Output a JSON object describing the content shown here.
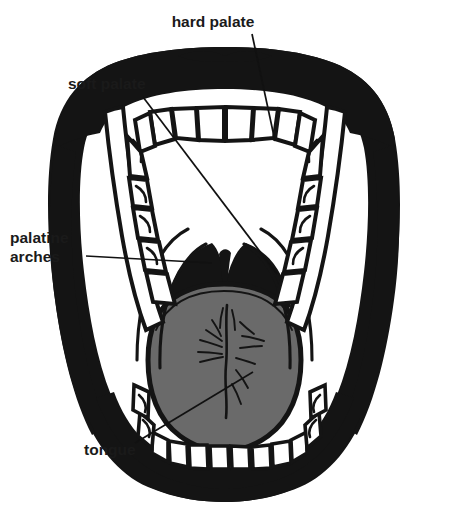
{
  "figure": {
    "view": "open mouth, anterior view",
    "background_color": "#ffffff",
    "ink_color": "#141414",
    "tongue_color": "#6a6a6a",
    "teeth_color": "#ffffff"
  },
  "labels": [
    {
      "id": "hard-palate",
      "text": "hard palate",
      "text_x": 213,
      "text_y": 27,
      "anchor": "middle",
      "leader": "M 252 34 L 275 141"
    },
    {
      "id": "soft-palate",
      "text": "soft palate",
      "text_x": 68,
      "text_y": 89,
      "anchor": "start",
      "leader": "M 143 97 L 277 274"
    },
    {
      "id": "palatine-arches",
      "text_line_1": "palatine",
      "text_line_2": "arches",
      "text_x": 10,
      "text_y": 243,
      "text_y2": 262,
      "anchor": "start",
      "leader": "M 86 256 L 212 263"
    },
    {
      "id": "tongue",
      "text": "tongue",
      "text_x": 84,
      "text_y": 455,
      "anchor": "start",
      "leader": "M 135 443 L 253 372"
    }
  ],
  "structures": [
    {
      "id": "lips",
      "name": "lips",
      "fill": "#141414"
    },
    {
      "id": "upper-teeth",
      "name": "upper dental arch",
      "fill": "#ffffff"
    },
    {
      "id": "lower-teeth",
      "name": "lower dental arch",
      "fill": "#ffffff"
    },
    {
      "id": "hard-palate-area",
      "name": "hard palate",
      "fill": "#ffffff"
    },
    {
      "id": "soft-palate-area",
      "name": "soft palate",
      "fill": "#ffffff"
    },
    {
      "id": "palatine-arch-left",
      "name": "left palatine arch",
      "fill": "none"
    },
    {
      "id": "palatine-arch-right",
      "name": "right palatine arch",
      "fill": "none"
    },
    {
      "id": "oropharynx",
      "name": "oropharynx / fauces",
      "fill": "#141414"
    },
    {
      "id": "uvula",
      "name": "uvula",
      "fill": "#141414"
    },
    {
      "id": "tongue-body",
      "name": "tongue",
      "fill": "#6a6a6a"
    },
    {
      "id": "median-sulcus",
      "name": "median sulcus of tongue",
      "fill": "none"
    }
  ]
}
